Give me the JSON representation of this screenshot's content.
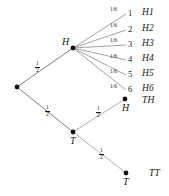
{
  "diagram": {
    "stroke_color": "#8a8a8a",
    "stroke_color_dark": "#6f6f6f",
    "node_color": "#111111",
    "text_color": "#1a1a1a",
    "background": "#ffffff"
  },
  "nodes": {
    "root": {
      "label": "",
      "x": 17,
      "y": 87
    },
    "heads": {
      "label": "H",
      "x": 73,
      "y": 48
    },
    "tails": {
      "label": "T",
      "x": 73,
      "y": 132
    },
    "tails_heads": {
      "label": "H",
      "x": 125,
      "y": 99
    },
    "tails_tails": {
      "label": "T",
      "x": 126,
      "y": 173
    }
  },
  "edges": {
    "root_to_heads": {
      "probability": "1/2",
      "numerator": "1",
      "denominator": "2"
    },
    "root_to_tails": {
      "probability": "1/2",
      "numerator": "1",
      "denominator": "2"
    },
    "tails_to_heads": {
      "probability": "1/2",
      "numerator": "1",
      "denominator": "2"
    },
    "tails_to_tails": {
      "probability": "1/2",
      "numerator": "1",
      "denominator": "2"
    }
  },
  "die_branches": [
    {
      "probability": "1/6",
      "face": "1",
      "outcome": "H1"
    },
    {
      "probability": "1/6",
      "face": "2",
      "outcome": "H2"
    },
    {
      "probability": "1/6",
      "face": "3",
      "outcome": "H3"
    },
    {
      "probability": "1/6",
      "face": "4",
      "outcome": "H4"
    },
    {
      "probability": "1/6",
      "face": "5",
      "outcome": "H5"
    },
    {
      "probability": "1/6",
      "face": "6",
      "outcome": "H6"
    }
  ],
  "terminal_outcomes": [
    {
      "label": "TH"
    },
    {
      "label": "TT"
    }
  ]
}
